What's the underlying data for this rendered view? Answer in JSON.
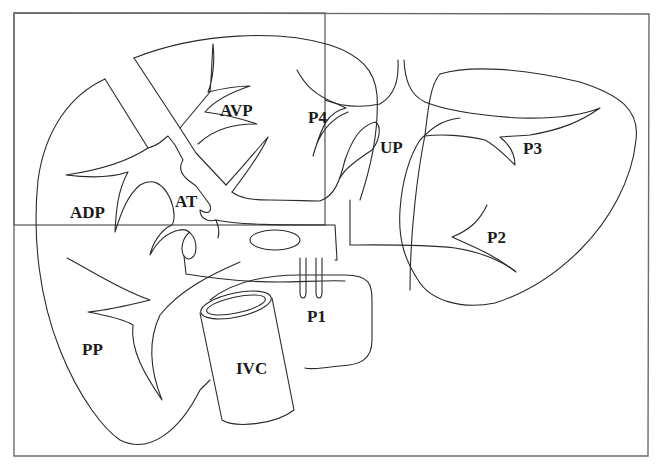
{
  "diagram": {
    "type": "anatomical line drawing",
    "colors": {
      "line": "#2a2a2a",
      "frame": "#6b6b6b",
      "background": "#ffffff",
      "text": "#1a1a1a"
    },
    "labels": {
      "avp": {
        "text": "AVP",
        "x": 220,
        "y": 116
      },
      "p4": {
        "text": "P4",
        "x": 308,
        "y": 123
      },
      "up": {
        "text": "UP",
        "x": 380,
        "y": 153
      },
      "p3": {
        "text": "P3",
        "x": 523,
        "y": 154
      },
      "adp": {
        "text": "ADP",
        "x": 70,
        "y": 218
      },
      "at": {
        "text": "AT",
        "x": 175,
        "y": 207
      },
      "p2": {
        "text": "P2",
        "x": 487,
        "y": 243
      },
      "p1": {
        "text": "P1",
        "x": 307,
        "y": 322
      },
      "pp": {
        "text": "PP",
        "x": 82,
        "y": 355
      },
      "ivc": {
        "text": "IVC",
        "x": 236,
        "y": 374
      }
    }
  }
}
